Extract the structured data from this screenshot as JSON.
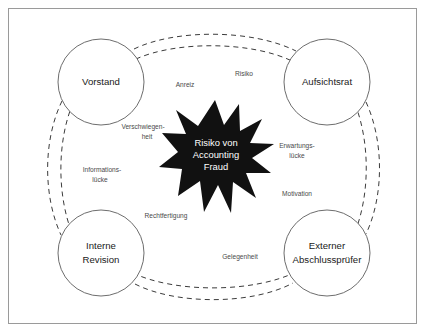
{
  "diagram": {
    "title": "Risiko von Accounting Fraud",
    "frame": {
      "stroke_color": "#9a9a9a",
      "background_color": "#ffffff"
    },
    "center": {
      "name": "star-burst",
      "shape": "starburst",
      "fill_color": "#111111",
      "text_color": "#ffffff",
      "lines": [
        "Risiko von",
        "Accounting",
        "Fraud"
      ]
    },
    "nodes": [
      {
        "id": "vorstand",
        "position": "top-left",
        "lines": [
          "Vorstand"
        ]
      },
      {
        "id": "aufsichtsrat",
        "position": "top-right",
        "lines": [
          "Aufsichtsrat"
        ]
      },
      {
        "id": "interne-revision",
        "position": "bottom-left",
        "lines": [
          "Interne",
          "Revision"
        ]
      },
      {
        "id": "externer-abschlusspruefer",
        "position": "bottom-right",
        "lines": [
          "Externer",
          "Abschlussprüfer"
        ]
      }
    ],
    "edge_labels": [
      {
        "id": "anreiz",
        "lines": [
          "Anreiz"
        ]
      },
      {
        "id": "risiko",
        "lines": [
          "Risiko"
        ]
      },
      {
        "id": "verschwiegenheit",
        "lines": [
          "Verschwiegen-",
          "heit"
        ]
      },
      {
        "id": "erwartungsluecke",
        "lines": [
          "Erwartungs-",
          "lücke"
        ]
      },
      {
        "id": "informationsluecke",
        "lines": [
          "Informations-",
          "lücke"
        ]
      },
      {
        "id": "motivation",
        "lines": [
          "Motivation"
        ]
      },
      {
        "id": "rechtfertigung",
        "lines": [
          "Rechtfertigung"
        ]
      },
      {
        "id": "gelegenheit",
        "lines": [
          "Gelegenheit"
        ]
      }
    ]
  }
}
